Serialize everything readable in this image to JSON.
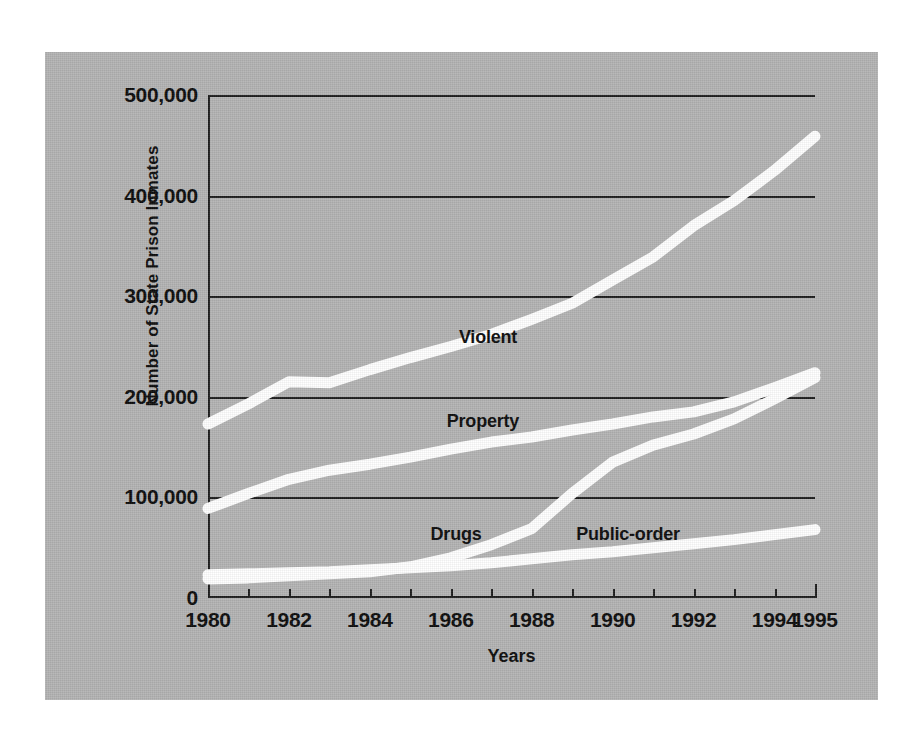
{
  "chart_data": {
    "type": "line",
    "title": "",
    "xlabel": "Years",
    "ylabel": "Number of State Prison Inmates",
    "xlim": [
      1980,
      1995
    ],
    "ylim": [
      0,
      500000
    ],
    "grid": true,
    "legend_position": "inline-labels",
    "x": [
      1980,
      1981,
      1982,
      1983,
      1984,
      1985,
      1986,
      1987,
      1988,
      1989,
      1990,
      1991,
      1992,
      1993,
      1994,
      1995
    ],
    "ytick_labels": [
      "500,000",
      "400,000",
      "300,000",
      "200,000",
      "100,000",
      "0"
    ],
    "ytick_values": [
      500000,
      400000,
      300000,
      200000,
      100000,
      0
    ],
    "xtick_labels": [
      "1980",
      "1982",
      "1984",
      "1986",
      "1988",
      "1990",
      "1992",
      "1994",
      "1995"
    ],
    "xtick_values": [
      1980,
      1982,
      1984,
      1986,
      1988,
      1990,
      1992,
      1994,
      1995
    ],
    "series": [
      {
        "name": "Violent",
        "color": "#ffffff",
        "label_x": 1986.2,
        "label_y": 258000,
        "values": [
          173000,
          193000,
          215000,
          214000,
          227000,
          239000,
          250000,
          262000,
          277000,
          293000,
          316000,
          339000,
          370000,
          395000,
          425000,
          459000
        ]
      },
      {
        "name": "Property",
        "color": "#ffffff",
        "label_x": 1985.9,
        "label_y": 175000,
        "values": [
          89000,
          104000,
          118000,
          127000,
          133000,
          140000,
          148000,
          155000,
          160000,
          167000,
          173000,
          180000,
          185000,
          195000,
          209000,
          224000
        ]
      },
      {
        "name": "Drugs",
        "color": "#ffffff",
        "label_x": 1985.5,
        "label_y": 63000,
        "values": [
          19000,
          20000,
          22000,
          24000,
          26000,
          31000,
          40000,
          53000,
          69000,
          104000,
          135000,
          152000,
          163000,
          178000,
          198000,
          219000
        ]
      },
      {
        "name": "Public-order",
        "color": "#ffffff",
        "label_x": 1989.1,
        "label_y": 63000,
        "values": [
          23000,
          24000,
          25000,
          26000,
          28000,
          30000,
          32000,
          35000,
          39000,
          43000,
          46000,
          50000,
          54000,
          58000,
          63000,
          68000
        ]
      }
    ]
  },
  "figure": {
    "panel_color": "#b3b3b3",
    "line_color": "#ffffff",
    "axis_color": "#1c1c1c",
    "text_color": "#0b0b0b",
    "background_color": "#ffffff"
  }
}
